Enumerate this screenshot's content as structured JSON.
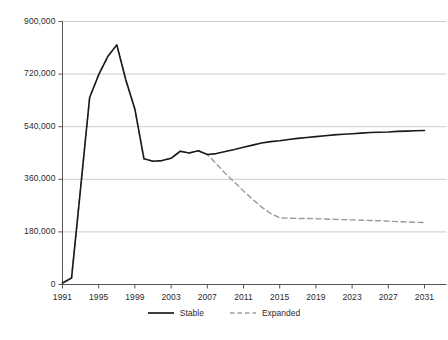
{
  "chart_data": {
    "type": "line",
    "title": "",
    "subtitle": "",
    "xlabel": "",
    "ylabel": "",
    "xlim": [
      1991,
      2031
    ],
    "ylim": [
      0,
      900000
    ],
    "grid": "horizontal",
    "legend_position": "bottom-center",
    "y_ticks": [
      0,
      180000,
      360000,
      540000,
      720000,
      900000
    ],
    "y_tick_labels": [
      "0",
      "180,000",
      "360,000",
      "540,000",
      "720,000",
      "900,000"
    ],
    "x_ticks": [
      1991,
      1995,
      1999,
      2003,
      2007,
      2011,
      2015,
      2019,
      2023,
      2027,
      2031
    ],
    "x_tick_labels": [
      "1991",
      "1995",
      "1999",
      "2003",
      "2007",
      "2011",
      "2015",
      "2019",
      "2023",
      "2027",
      "2031"
    ],
    "series": [
      {
        "name": "Stable",
        "color": "#1a1a1a",
        "style": "solid",
        "x": [
          1991,
          1992,
          1993,
          1994,
          1995,
          1996,
          1997,
          1998,
          1999,
          2000,
          2001,
          2002,
          2003,
          2004,
          2005,
          2006,
          2007,
          2008,
          2009,
          2010,
          2011,
          2012,
          2013,
          2014,
          2015,
          2016,
          2017,
          2018,
          2019,
          2020,
          2021,
          2022,
          2023,
          2024,
          2025,
          2026,
          2027,
          2028,
          2029,
          2030,
          2031
        ],
        "values": [
          5000,
          22000,
          330000,
          640000,
          718000,
          780000,
          820000,
          700000,
          600000,
          430000,
          422000,
          424000,
          432000,
          456000,
          450000,
          458000,
          445000,
          448000,
          455000,
          462000,
          470000,
          477000,
          484000,
          489000,
          492000,
          496000,
          500000,
          503000,
          506000,
          509000,
          512000,
          514000,
          516000,
          518000,
          520000,
          521000,
          522000,
          524000,
          525000,
          526000,
          527000
        ]
      },
      {
        "name": "Expanded",
        "color": "#9a9a9a",
        "style": "dashed",
        "x": [
          1991,
          1992,
          1993,
          1994,
          1995,
          1996,
          1997,
          1998,
          1999,
          2000,
          2001,
          2002,
          2003,
          2004,
          2005,
          2006,
          2007,
          2008,
          2009,
          2010,
          2011,
          2012,
          2013,
          2014,
          2015,
          2016,
          2017,
          2018,
          2019,
          2020,
          2021,
          2022,
          2023,
          2024,
          2025,
          2026,
          2027,
          2028,
          2029,
          2030,
          2031
        ],
        "values": [
          5000,
          22000,
          330000,
          640000,
          718000,
          780000,
          820000,
          700000,
          600000,
          430000,
          422000,
          424000,
          432000,
          456000,
          450000,
          458000,
          445000,
          413000,
          380000,
          350000,
          320000,
          292000,
          265000,
          243000,
          228000,
          227000,
          226000,
          226000,
          225000,
          224000,
          223000,
          222000,
          221000,
          220000,
          219000,
          218000,
          217000,
          215000,
          214000,
          213000,
          212000
        ]
      }
    ],
    "legend": [
      {
        "label": "Stable",
        "color": "#1a1a1a",
        "style": "solid"
      },
      {
        "label": "Expanded",
        "color": "#9a9a9a",
        "style": "dashed"
      }
    ],
    "axis_color": "#555555",
    "grid_color": "#cccccc",
    "background": "#ffffff"
  }
}
